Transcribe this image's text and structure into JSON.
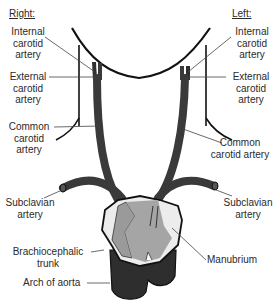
{
  "diagram": {
    "headers": {
      "right": "Right:",
      "left": "Left:"
    },
    "labels": {
      "internal_carotid_right": [
        "Internal",
        "carotid",
        "artery"
      ],
      "external_carotid_right": [
        "External",
        "carotid",
        "artery"
      ],
      "common_carotid_right": [
        "Common",
        "carotid",
        "artery"
      ],
      "subclavian_right": [
        "Subclavian",
        "artery"
      ],
      "brachiocephalic_trunk": [
        "Brachiocephalic",
        "trunk"
      ],
      "arch_of_aorta": "Arch of aorta",
      "internal_carotid_left": [
        "Internal",
        "carotid",
        "artery"
      ],
      "external_carotid_left": [
        "External",
        "carotid",
        "artery"
      ],
      "common_carotid_left": [
        "Common",
        "carotid artery"
      ],
      "subclavian_left": [
        "Subclavian",
        "artery"
      ],
      "manubrium": "Manubrium"
    },
    "colors": {
      "artery": "#3a3a3a",
      "aorta": "#2e2e2e",
      "manubrium_fill": "#ececec",
      "manubrium_inner": "#9a9a9a",
      "outline": "#111111",
      "leader": "#444444"
    }
  }
}
